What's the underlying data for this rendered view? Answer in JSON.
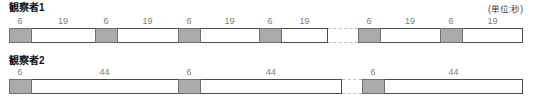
{
  "unit_note": "(単位:秒)",
  "observers": [
    {
      "label": "観察者1",
      "gap": {
        "x": 328,
        "w": 30
      },
      "runs": [
        {
          "x": 9,
          "segments": [
            {
              "label": "6",
              "kind": "shaded",
              "w": 22
            },
            {
              "label": "19",
              "kind": "open",
              "w": 64
            },
            {
              "label": "6",
              "kind": "shaded",
              "w": 22
            },
            {
              "label": "19",
              "kind": "open",
              "w": 61
            },
            {
              "label": "6",
              "kind": "shaded",
              "w": 22
            },
            {
              "label": "19",
              "kind": "open",
              "w": 59
            },
            {
              "label": "6",
              "kind": "shaded",
              "w": 22
            },
            {
              "label": "19",
              "kind": "open",
              "w": 47
            }
          ]
        },
        {
          "x": 358,
          "segments": [
            {
              "label": "6",
              "kind": "shaded",
              "w": 22
            },
            {
              "label": "19",
              "kind": "open",
              "w": 60
            },
            {
              "label": "6",
              "kind": "shaded",
              "w": 22
            },
            {
              "label": "19",
              "kind": "open",
              "w": 61
            }
          ]
        }
      ]
    },
    {
      "label": "観察者2",
      "gap": {
        "x": 342,
        "w": 20
      },
      "runs": [
        {
          "x": 9,
          "segments": [
            {
              "label": "6",
              "kind": "shaded",
              "w": 22
            },
            {
              "label": "44",
              "kind": "open",
              "w": 147
            },
            {
              "label": "6",
              "kind": "shaded",
              "w": 22
            },
            {
              "label": "44",
              "kind": "open",
              "w": 142
            }
          ]
        },
        {
          "x": 362,
          "segments": [
            {
              "label": "6",
              "kind": "shaded",
              "w": 22
            },
            {
              "label": "44",
              "kind": "open",
              "w": 139
            }
          ]
        }
      ]
    }
  ],
  "colors": {
    "shaded_fill": "#aaaaaa",
    "shaded_border": "#6e6e6e",
    "bar_border": "#4a4a4a",
    "gap_dash": "#c0c0c0",
    "number_text": "#7d7d7d",
    "label_text": "#111111",
    "note_text": "#3c3c3c"
  }
}
